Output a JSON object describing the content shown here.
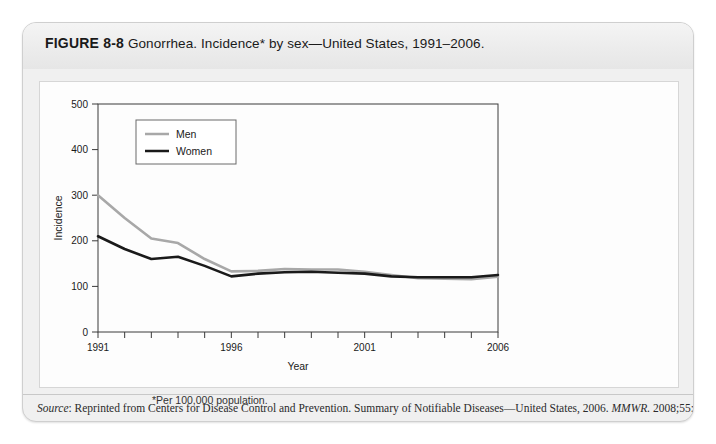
{
  "figure": {
    "label": "FIGURE 8-8",
    "title": "Gonorrhea. Incidence* by sex—United States, 1991–2006.",
    "footnote": "*Per 100,000 population."
  },
  "source": {
    "prefix": "Source",
    "colon": ": ",
    "text_before_journal": "Reprinted from Centers for Disease Control and Prevention. Summary of Notifiable Diseases—United States, 2006. ",
    "journal": "MMWR.",
    "text_after_journal": " 2008;55:52."
  },
  "colors": {
    "men_line": "#a8a8a8",
    "women_line": "#1a1a1a",
    "axis": "#333333",
    "panel_background": "#fdfdfd",
    "header_background": "#ececec"
  },
  "chart_data": {
    "type": "line",
    "title": "Gonorrhea. Incidence* by sex—United States, 1991–2006.",
    "xlabel": "Year",
    "ylabel": "Incidence",
    "xlim": [
      1991,
      2006
    ],
    "ylim": [
      0,
      500
    ],
    "ytick_values": [
      0,
      100,
      200,
      300,
      400,
      500
    ],
    "ytick_labels": [
      "0",
      "100",
      "200",
      "300",
      "400",
      "500"
    ],
    "xtick_values": [
      1991,
      1992,
      1993,
      1994,
      1995,
      1996,
      1997,
      1998,
      1999,
      2000,
      2001,
      2002,
      2003,
      2004,
      2005,
      2006
    ],
    "xtick_labels_shown": [
      "1991",
      "1996",
      "2001",
      "2006"
    ],
    "xtick_labels_shown_values": [
      1991,
      1996,
      2001,
      2006
    ],
    "grid": false,
    "legend_position": "upper left inside",
    "x": [
      1991,
      1992,
      1993,
      1994,
      1995,
      1996,
      1997,
      1998,
      1999,
      2000,
      2001,
      2002,
      2003,
      2004,
      2005,
      2006
    ],
    "series": [
      {
        "name": "Men",
        "color": "#a8a8a8",
        "values": [
          300,
          250,
          205,
          195,
          160,
          133,
          134,
          138,
          137,
          137,
          132,
          125,
          118,
          117,
          116,
          121
        ]
      },
      {
        "name": "Women",
        "color": "#1a1a1a",
        "values": [
          210,
          182,
          160,
          165,
          145,
          122,
          128,
          131,
          132,
          130,
          128,
          122,
          120,
          120,
          120,
          125
        ]
      }
    ]
  }
}
